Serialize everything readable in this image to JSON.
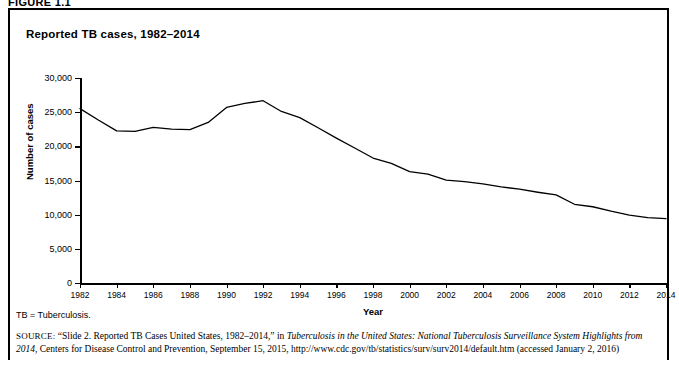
{
  "figure": {
    "label": "FIGURE 1.1",
    "title": "Reported TB cases, 1982–2014",
    "abbreviation_note": "TB = Tuberculosis.",
    "source_prefix": "SOURCE:",
    "source_part1": "“Slide 2. Reported TB Cases United States, 1982–2014,” in ",
    "source_italic1": "Tuberculosis in the United States: National Tuberculosis Surveillance System Highlights from 2014",
    "source_part2": ", Centers for Disease Control and Prevention, September 15, 2015, http://www.cdc.gov/tb/statistics/surv/surv2014/default.htm (accessed January 2, 2016)"
  },
  "chart_data": {
    "type": "line",
    "title": "Reported TB cases, 1982–2014",
    "xlabel": "Year",
    "ylabel": "Number of cases",
    "xlim": [
      1982,
      2014
    ],
    "ylim": [
      0,
      30000
    ],
    "ytick_labels": [
      "0",
      "5,000",
      "10,000",
      "15,000",
      "20,000",
      "25,000",
      "30,000"
    ],
    "ytick_values": [
      0,
      5000,
      10000,
      15000,
      20000,
      25000,
      30000
    ],
    "xtick_labels": [
      "1982",
      "1984",
      "1986",
      "1988",
      "1990",
      "1992",
      "1994",
      "1996",
      "1998",
      "2000",
      "2002",
      "2004",
      "2006",
      "2008",
      "2010",
      "2012",
      "2014"
    ],
    "xtick_values": [
      1982,
      1984,
      1986,
      1988,
      1990,
      1992,
      1994,
      1996,
      1998,
      2000,
      2002,
      2004,
      2006,
      2008,
      2010,
      2012,
      2014
    ],
    "grid": false,
    "legend": null,
    "line_color": "#000000",
    "x": [
      1982,
      1983,
      1984,
      1985,
      1986,
      1987,
      1988,
      1989,
      1990,
      1991,
      1992,
      1993,
      1994,
      1995,
      1996,
      1997,
      1998,
      1999,
      2000,
      2001,
      2002,
      2003,
      2004,
      2005,
      2006,
      2007,
      2008,
      2009,
      2010,
      2011,
      2012,
      2013,
      2014
    ],
    "values": [
      25520,
      23846,
      22255,
      22201,
      22768,
      22517,
      22436,
      23495,
      25701,
      26283,
      26673,
      25102,
      24206,
      22726,
      21210,
      19751,
      18286,
      17499,
      16308,
      15945,
      15056,
      14835,
      14499,
      14060,
      13728,
      13282,
      12895,
      11520,
      11159,
      10509,
      9940,
      9565,
      9412
    ],
    "series": [
      {
        "name": "Reported TB cases",
        "values": [
          25520,
          23846,
          22255,
          22201,
          22768,
          22517,
          22436,
          23495,
          25701,
          26283,
          26673,
          25102,
          24206,
          22726,
          21210,
          19751,
          18286,
          17499,
          16308,
          15945,
          15056,
          14835,
          14499,
          14060,
          13728,
          13282,
          12895,
          11520,
          11159,
          10509,
          9940,
          9565,
          9412
        ]
      }
    ]
  }
}
